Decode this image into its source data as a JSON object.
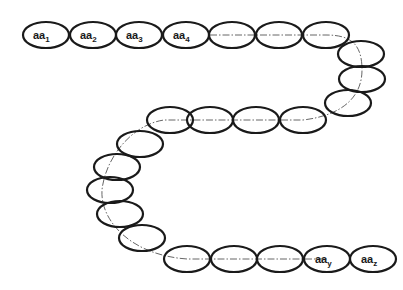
{
  "diagram": {
    "type": "polypeptide-chain",
    "residue_count": 25,
    "labels": {
      "aa1": {
        "base": "aa",
        "sub": "1"
      },
      "aa2": {
        "base": "aa",
        "sub": "2"
      },
      "aa3": {
        "base": "aa",
        "sub": "3"
      },
      "aa4": {
        "base": "aa",
        "sub": "4"
      },
      "aay": {
        "base": "aa",
        "sub": "y"
      },
      "aaz": {
        "base": "aa",
        "sub": "z"
      }
    },
    "colors": {
      "outline": "#1a1a1a",
      "backbone": "#555555",
      "background": "#ffffff"
    }
  }
}
